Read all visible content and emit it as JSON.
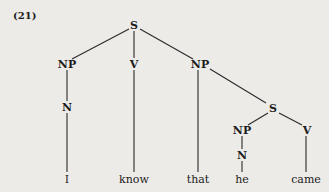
{
  "example_label": "(21)",
  "tree": {
    "root": {
      "label": "S"
    },
    "np1": {
      "label": "NP"
    },
    "n1": {
      "label": "N"
    },
    "v1": {
      "label": "V"
    },
    "np2": {
      "label": "NP"
    },
    "s2": {
      "label": "S"
    },
    "np3": {
      "label": "NP"
    },
    "n3": {
      "label": "N"
    },
    "v2": {
      "label": "V"
    }
  },
  "words": [
    "I",
    "know",
    "that",
    "he",
    "came"
  ]
}
